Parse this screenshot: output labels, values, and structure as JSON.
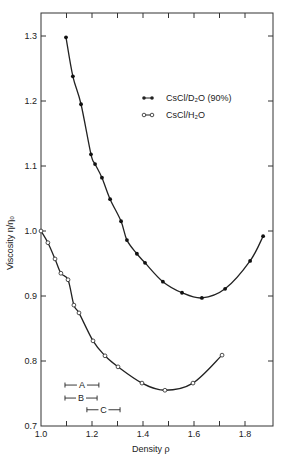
{
  "chart_data": {
    "type": "line",
    "title": "",
    "xlabel": "Density ρ",
    "ylabel": "Viscosity η/η₀",
    "xlim": [
      1.0,
      1.9
    ],
    "ylim": [
      0.7,
      1.33
    ],
    "x_ticks": [
      1.0,
      1.1,
      1.2,
      1.3,
      1.4,
      1.5,
      1.6,
      1.7,
      1.8
    ],
    "x_tick_labels": [
      "1.0",
      "",
      "1.2",
      "",
      "1.4",
      "",
      "1.6",
      "",
      "1.8"
    ],
    "y_ticks": [
      0.7,
      0.8,
      0.9,
      1.0,
      1.1,
      1.2,
      1.3
    ],
    "y_tick_labels": [
      "0.7",
      "0.8",
      "0.9",
      "1.0",
      "1.1",
      "1.2",
      "1.3"
    ],
    "grid": false,
    "legend_position": "upper right (inside)",
    "series": [
      {
        "name": "CsCl/D₂O (90%)",
        "marker": "filled-circle",
        "x": [
          1.098,
          1.125,
          1.157,
          1.196,
          1.212,
          1.239,
          1.271,
          1.314,
          1.337,
          1.376,
          1.408,
          1.478,
          1.553,
          1.631,
          1.722,
          1.82,
          1.871
        ],
        "y": [
          1.298,
          1.238,
          1.195,
          1.118,
          1.103,
          1.082,
          1.049,
          1.015,
          0.986,
          0.965,
          0.951,
          0.922,
          0.905,
          0.897,
          0.911,
          0.954,
          0.992
        ]
      },
      {
        "name": "CsCl/H₂O",
        "marker": "open-circle",
        "x": [
          1.0,
          1.027,
          1.055,
          1.078,
          1.106,
          1.129,
          1.149,
          1.204,
          1.251,
          1.302,
          1.396,
          1.486,
          1.596,
          1.71
        ],
        "y": [
          1.0,
          0.982,
          0.957,
          0.935,
          0.925,
          0.886,
          0.874,
          0.831,
          0.808,
          0.791,
          0.766,
          0.755,
          0.766,
          0.809
        ]
      }
    ],
    "annotations": [
      {
        "label": "A",
        "type": "range-bar",
        "x_start": 1.094,
        "x_end": 1.227,
        "y": 0.763
      },
      {
        "label": "B",
        "type": "range-bar",
        "x_start": 1.094,
        "x_end": 1.22,
        "y": 0.743
      },
      {
        "label": "C",
        "type": "range-bar",
        "x_start": 1.18,
        "x_end": 1.31,
        "y": 0.725
      }
    ]
  },
  "legend": {
    "d2o_label": "CsCl/D₂O (90%)",
    "h2o_label": "CsCl/H₂O"
  },
  "axes": {
    "xlabel": "Density ρ",
    "ylabel": "Viscosity η/η₀"
  }
}
